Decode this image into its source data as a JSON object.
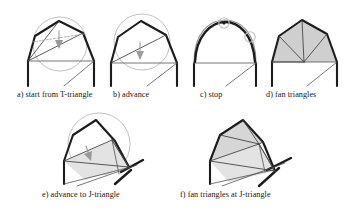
{
  "figure": {
    "background_color": "#ffffff",
    "ink_color": "#1c1c1c",
    "thin_line_color": "#4a4a4a",
    "circle_color": "#b0b0b0",
    "arrow_color": "#9a9a9a",
    "fill_gray": "#cfcfcf",
    "fill_light": "#e3e3e3"
  },
  "panels": [
    {
      "id": "a",
      "caption": "a) start from T-triangle",
      "has_circumcircle": true,
      "has_arrow": true,
      "has_fill": false,
      "shape": "polyline-arch"
    },
    {
      "id": "b",
      "caption": "b) advance",
      "has_circumcircle": true,
      "has_arrow": true,
      "has_fill": false,
      "shape": "polyline-arch"
    },
    {
      "id": "c",
      "caption": "c) stop",
      "has_circumcircle": false,
      "has_arrow": false,
      "has_fill": false,
      "marker_circles": 2,
      "shape": "smooth-arch"
    },
    {
      "id": "d",
      "caption": "d) fan triangles",
      "has_circumcircle": false,
      "has_arrow": false,
      "has_fill": true,
      "fan_lines": 4,
      "shape": "polyline-arch"
    },
    {
      "id": "e",
      "caption": "e) advance to J-triangle",
      "has_circumcircle": true,
      "has_arrow": true,
      "has_fill": true,
      "shape": "rotated-arch"
    },
    {
      "id": "f",
      "caption": "f) fan triangles at J-triangle",
      "has_circumcircle": false,
      "has_arrow": false,
      "has_fill": true,
      "fan_lines": 4,
      "shape": "rotated-arch"
    }
  ],
  "captions": {
    "a": "a) start from T-triangle",
    "b": "b) advance",
    "c": "c) stop",
    "d": "d) fan triangles",
    "e": "e) advance to J-triangle",
    "f": "f) fan triangles at J-triangle"
  }
}
